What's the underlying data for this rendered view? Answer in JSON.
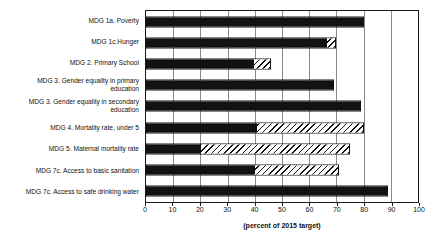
{
  "chart_data": {
    "type": "bar",
    "orientation": "horizontal",
    "title": "",
    "xlabel": "(percent of 2015 target)",
    "ylabel": "",
    "xlim": [
      0,
      100
    ],
    "xticks": [
      0,
      10,
      20,
      30,
      40,
      50,
      60,
      70,
      80,
      90,
      100
    ],
    "grid": true,
    "legend": null,
    "categories": [
      "MDG 1a. Poverty",
      "MDG 1c.Hunger",
      "MDG 2. Primary School",
      "MDG 3. Gender equality in primary\neducation",
      "MDG 3. Gender equality in secondary\neducation",
      "MDG 4. Mortality rate, under 5",
      "MDG 5. Maternal mortality rate",
      "MDG 7c. Access to basic sanitation",
      "MDG 7c. Access to safe drinking water"
    ],
    "series": [
      {
        "name": "achieved",
        "fill": "solid",
        "values": [
          80,
          67,
          40,
          69,
          79,
          41,
          20,
          40,
          89
        ]
      },
      {
        "name": "projected-gap",
        "fill": "hatched",
        "values": [
          0,
          3,
          6,
          0,
          0,
          39,
          55,
          31,
          0
        ]
      }
    ],
    "totals": [
      80,
      70,
      46,
      69,
      79,
      80,
      75,
      71,
      89
    ],
    "units": "percent of 2015 target"
  },
  "colors": {
    "solid": "#121212",
    "hatch_line": "#111111",
    "hatch_background": "#ffffff",
    "gridline": "#8a8a8a",
    "axis": "#1a1a1a",
    "text": "#111111",
    "background": "#ffffff"
  }
}
